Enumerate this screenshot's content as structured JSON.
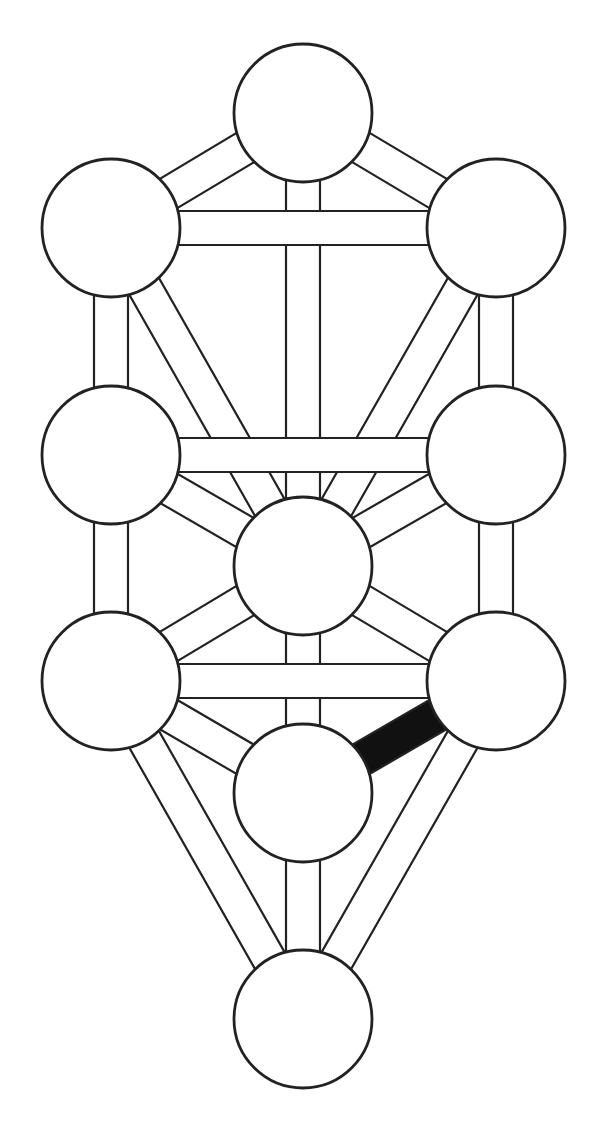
{
  "diagram": {
    "colors": {
      "background": "#ffffff",
      "stroke": "#222222",
      "fill": "#ffffff",
      "highlight": "#111111"
    },
    "band_width": 34,
    "stroke_width": 2.2,
    "node_radius": 69,
    "nodes": [
      {
        "id": "kether",
        "label": "Kether",
        "x": 303,
        "y": 113
      },
      {
        "id": "binah",
        "label": "Binah",
        "x": 111,
        "y": 228
      },
      {
        "id": "chokmah",
        "label": "Chokmah",
        "x": 496,
        "y": 228
      },
      {
        "id": "geburah",
        "label": "Geburah",
        "x": 111,
        "y": 455
      },
      {
        "id": "chesed",
        "label": "Chesed",
        "x": 496,
        "y": 455
      },
      {
        "id": "tiphareth",
        "label": "Tiphareth",
        "x": 303,
        "y": 566
      },
      {
        "id": "hod",
        "label": "Hod",
        "x": 111,
        "y": 681
      },
      {
        "id": "netzach",
        "label": "Netzach",
        "x": 496,
        "y": 681
      },
      {
        "id": "yesod",
        "label": "Yesod",
        "x": 303,
        "y": 793
      },
      {
        "id": "malkuth",
        "label": "Malkuth",
        "x": 303,
        "y": 1019
      }
    ],
    "paths": [
      {
        "from": "kether",
        "to": "binah",
        "highlighted": false
      },
      {
        "from": "kether",
        "to": "chokmah",
        "highlighted": false
      },
      {
        "from": "kether",
        "to": "tiphareth",
        "highlighted": false
      },
      {
        "from": "binah",
        "to": "tiphareth",
        "highlighted": false
      },
      {
        "from": "chokmah",
        "to": "tiphareth",
        "highlighted": false
      },
      {
        "from": "binah",
        "to": "geburah",
        "highlighted": false
      },
      {
        "from": "chokmah",
        "to": "chesed",
        "highlighted": false
      },
      {
        "from": "geburah",
        "to": "tiphareth",
        "highlighted": false
      },
      {
        "from": "chesed",
        "to": "tiphareth",
        "highlighted": false
      },
      {
        "from": "geburah",
        "to": "hod",
        "highlighted": false
      },
      {
        "from": "chesed",
        "to": "netzach",
        "highlighted": false
      },
      {
        "from": "hod",
        "to": "tiphareth",
        "highlighted": false
      },
      {
        "from": "netzach",
        "to": "tiphareth",
        "highlighted": false
      },
      {
        "from": "tiphareth",
        "to": "yesod",
        "highlighted": false
      },
      {
        "from": "hod",
        "to": "yesod",
        "highlighted": false
      },
      {
        "from": "hod",
        "to": "malkuth",
        "highlighted": false
      },
      {
        "from": "netzach",
        "to": "malkuth",
        "highlighted": false
      },
      {
        "from": "yesod",
        "to": "malkuth",
        "highlighted": false
      },
      {
        "from": "binah",
        "to": "chokmah",
        "highlighted": false
      },
      {
        "from": "geburah",
        "to": "chesed",
        "highlighted": false
      },
      {
        "from": "hod",
        "to": "netzach",
        "highlighted": false
      },
      {
        "from": "yesod",
        "to": "netzach",
        "highlighted": true
      }
    ]
  }
}
